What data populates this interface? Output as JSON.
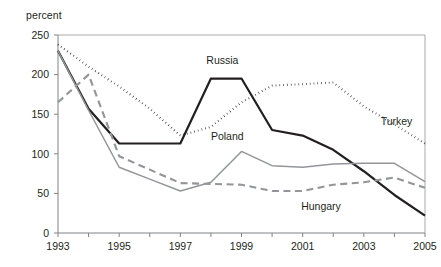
{
  "chart_data": {
    "type": "line",
    "title": "",
    "xlabel": "",
    "ylabel": "percent",
    "ylim": [
      0,
      250
    ],
    "xlim": [
      1993,
      2005
    ],
    "yticks": [
      0,
      50,
      100,
      150,
      200,
      250
    ],
    "ytick_labels": [
      "0",
      "50",
      "100",
      "150",
      "200",
      "250"
    ],
    "x": [
      1993,
      1994,
      1995,
      1996,
      1997,
      1998,
      1999,
      2000,
      2001,
      2002,
      2003,
      2004,
      2005
    ],
    "xticks": [
      1993,
      1994,
      1995,
      1996,
      1997,
      1998,
      1999,
      2000,
      2001,
      2002,
      2003,
      2004,
      2005
    ],
    "xtick_labels": [
      "1993",
      "",
      "1995",
      "",
      "1997",
      "",
      "1999",
      "",
      "2001",
      "",
      "2003",
      "",
      "2005"
    ],
    "grid": false,
    "legend": "inline-annotations",
    "series": [
      {
        "name": "Turkey",
        "style": "dotted",
        "color": "#231f20",
        "width": 2.1,
        "label_x": 2003.55,
        "label_y": 136,
        "values": [
          238,
          210,
          185,
          157,
          123,
          134,
          165,
          186,
          188,
          190,
          160,
          137,
          113
        ]
      },
      {
        "name": "Russia",
        "style": "solid-thick",
        "color": "#231f20",
        "width": 2.2,
        "label_x": 1997.85,
        "label_y": 213,
        "values": [
          230,
          157,
          113,
          113,
          113,
          195,
          195,
          130,
          123,
          105,
          78,
          48,
          22
        ]
      },
      {
        "name": "Poland",
        "style": "solid-thin",
        "color": "#939598",
        "width": 1.5,
        "label_x": 1998.0,
        "label_y": 117,
        "values": [
          230,
          155,
          83,
          68,
          53,
          64,
          103,
          85,
          83,
          87,
          88,
          88,
          65
        ]
      },
      {
        "name": "Hungary",
        "style": "dashed",
        "color": "#939598",
        "width": 2.1,
        "label_x": 2000.95,
        "label_y": 29,
        "values": [
          165,
          200,
          97,
          80,
          63,
          62,
          61,
          53,
          53,
          61,
          64,
          70,
          57
        ]
      }
    ]
  },
  "axis": {
    "unit_label": "percent"
  }
}
